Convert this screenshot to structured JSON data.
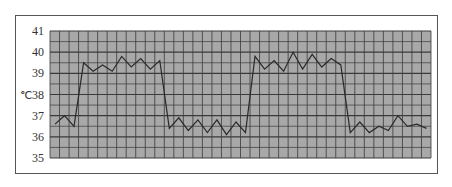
{
  "chart_data": {
    "type": "line",
    "title": "",
    "xlabel": "",
    "ylabel": "℃",
    "ylim": [
      35,
      41
    ],
    "yticks": [
      35,
      36,
      37,
      38,
      39,
      40,
      41
    ],
    "grid": true,
    "grid_minor_step": 0.5,
    "grid_columns": 40,
    "legend": null,
    "colors": {
      "plot_bg": "#a8a8a8",
      "grid": "#3a3a3a",
      "line": "#2a2a2a",
      "frame": "#555555"
    },
    "x": [
      1,
      2,
      3,
      4,
      5,
      6,
      7,
      8,
      9,
      10,
      11,
      12,
      13,
      14,
      15,
      16,
      17,
      18,
      19,
      20,
      21,
      22,
      23,
      24,
      25,
      26,
      27,
      28,
      29,
      30,
      31,
      32,
      33,
      34,
      35,
      36,
      37,
      38,
      39,
      40
    ],
    "series": [
      {
        "name": "Body temperature",
        "values": [
          36.6,
          37.0,
          36.5,
          39.5,
          39.1,
          39.4,
          39.1,
          39.8,
          39.3,
          39.7,
          39.2,
          39.6,
          36.4,
          36.9,
          36.3,
          36.8,
          36.2,
          36.8,
          36.1,
          36.7,
          36.2,
          39.8,
          39.2,
          39.6,
          39.1,
          40.0,
          39.2,
          39.9,
          39.3,
          39.7,
          39.4,
          36.2,
          36.7,
          36.2,
          36.5,
          36.3,
          37.0,
          36.5,
          36.6,
          36.4
        ]
      }
    ]
  }
}
